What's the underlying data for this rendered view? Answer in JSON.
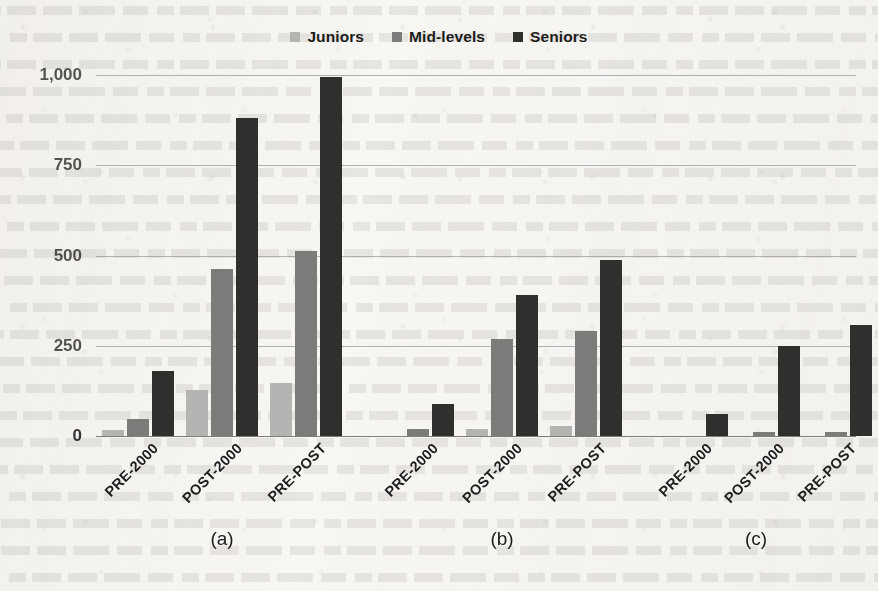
{
  "chart_data": {
    "type": "bar",
    "title": "",
    "subtitle": "",
    "xlabel": "",
    "ylabel": "",
    "ylim": [
      0,
      1000
    ],
    "yticks": [
      0,
      250,
      500,
      750,
      1000
    ],
    "ytick_labels": [
      "0",
      "250",
      "500",
      "750",
      "1,000"
    ],
    "grid": true,
    "legend_position": "top-center",
    "categories": [
      "PRE-2000",
      "POST-2000",
      "PRE-POST"
    ],
    "series": [
      {
        "name": "Juniors",
        "color": "#b4b4b2"
      },
      {
        "name": "Mid-levels",
        "color": "#7b7b79"
      },
      {
        "name": "Seniors",
        "color": "#2f2f2e"
      }
    ],
    "panels": [
      {
        "label": "(a)",
        "categories": [
          "PRE-2000",
          "POST-2000",
          "PRE-POST"
        ],
        "series": [
          {
            "name": "Juniors",
            "values": [
              18,
              128,
              148
            ]
          },
          {
            "name": "Mid-levels",
            "values": [
              48,
              463,
              512
            ]
          },
          {
            "name": "Seniors",
            "values": [
              180,
              880,
              995
            ]
          }
        ]
      },
      {
        "label": "(b)",
        "categories": [
          "PRE-2000",
          "POST-2000",
          "PRE-POST"
        ],
        "series": [
          {
            "name": "Juniors",
            "values": [
              0,
              20,
              28
            ]
          },
          {
            "name": "Mid-levels",
            "values": [
              20,
              268,
              290
            ]
          },
          {
            "name": "Seniors",
            "values": [
              88,
              392,
              487
            ]
          }
        ]
      },
      {
        "label": "(c)",
        "categories": [
          "PRE-2000",
          "POST-2000",
          "PRE-POST"
        ],
        "series": [
          {
            "name": "Juniors",
            "values": [
              0,
              0,
              0
            ]
          },
          {
            "name": "Mid-levels",
            "values": [
              0,
              10,
              12
            ]
          },
          {
            "name": "Seniors",
            "values": [
              62,
              250,
              308
            ]
          }
        ]
      }
    ]
  },
  "legend": {
    "items": [
      {
        "label": "Juniors",
        "color": "#b4b4b2"
      },
      {
        "label": "Mid-levels",
        "color": "#7b7b79"
      },
      {
        "label": "Seniors",
        "color": "#2f2f2e"
      }
    ]
  },
  "axis": {
    "y_ticks": [
      {
        "label": "1,000",
        "value": 1000
      },
      {
        "label": "750",
        "value": 750
      },
      {
        "label": "500",
        "value": 500
      },
      {
        "label": "250",
        "value": 250
      },
      {
        "label": "0",
        "value": 0
      }
    ]
  },
  "panel_labels": [
    "(a)",
    "(b)",
    "(c)"
  ],
  "x_tick_labels": [
    "PRE-2000",
    "POST-2000",
    "PRE-POST",
    "PRE-2000",
    "POST-2000",
    "PRE-POST",
    "PRE-2000",
    "POST-2000",
    "PRE-POST"
  ]
}
